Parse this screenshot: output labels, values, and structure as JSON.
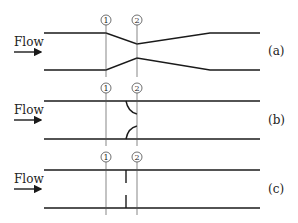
{
  "figure": {
    "panels": [
      {
        "id": "a",
        "label": "(a)",
        "device": "venturi",
        "flow_label": "Flow",
        "station_1": "1",
        "station_2": "2"
      },
      {
        "id": "b",
        "label": "(b)",
        "device": "nozzle",
        "flow_label": "Flow",
        "station_1": "1",
        "station_2": "2"
      },
      {
        "id": "c",
        "label": "(c)",
        "device": "orifice plate",
        "flow_label": "Flow",
        "station_1": "1",
        "station_2": "2"
      }
    ]
  },
  "colors": {
    "line": "#1a1a1a",
    "station": "#555555",
    "background": "#ffffff"
  }
}
